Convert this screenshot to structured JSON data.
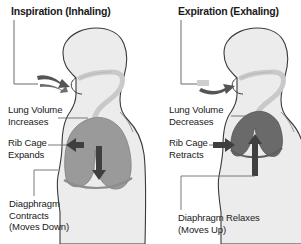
{
  "figure": {
    "background_color": "#ffffff",
    "body_fill": "#ececec",
    "body_outline": "#3a3a3a",
    "airway_fill": "#c9c9c9",
    "lung_inhale_fill": "#9a9a9a",
    "lung_exhale_fill": "#6a6a6a",
    "arrow_color": "#3f3f3f",
    "text_color": "#1a1a1a",
    "leader_color": "#6b6b6b"
  },
  "panels": {
    "inspiration": {
      "title": "Inspiration (Inhaling)",
      "airflow_icon": "air-inflow-arrow",
      "labels": {
        "lung": "Lung Volume\nIncreases",
        "rib": "Rib Cage\nExpands",
        "diaphragm": "Diagphragm\nContracts\n(Moves Down)"
      },
      "arrows": {
        "rib_icon": "arrow-left",
        "diaphragm_icon": "arrow-down"
      }
    },
    "expiration": {
      "title": "Expiration (Exhaling)",
      "airflow_icon": "air-outflow-arrow",
      "labels": {
        "lung": "Lung Volume\nDecreases",
        "rib": "Rib Cage\nRetracts",
        "diaphragm": "Diaphragm Relaxes\n(Moves Up)"
      },
      "arrows": {
        "rib_icon": "arrow-right",
        "diaphragm_icon": "arrow-up"
      }
    }
  }
}
